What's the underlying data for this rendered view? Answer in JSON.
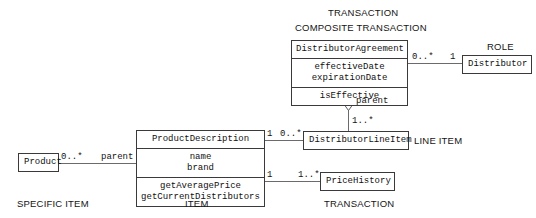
{
  "diagram": {
    "title_visible": false,
    "kind": "uml-class-diagram",
    "line_color": "#6b6b6b",
    "box_border_color": "#3a3a3a",
    "text_color": "#141414",
    "background": "#ffffff"
  },
  "classes": {
    "distributor_agreement": {
      "name": "DistributorAgreement",
      "attributes": [
        "effectiveDate",
        "expirationDate"
      ],
      "operations": [
        "isEffective"
      ]
    },
    "distributor": {
      "name": "Distributor"
    },
    "product_description": {
      "name": "ProductDescription",
      "attributes": [
        "name",
        "brand"
      ],
      "operations": [
        "getAveragePrice",
        "getCurrentDistributors"
      ]
    },
    "product": {
      "name": "Product"
    },
    "distributor_line_item": {
      "name": "DistributorLineItem"
    },
    "price_history": {
      "name": "PriceHistory"
    }
  },
  "annotations": {
    "transaction_top": "TRANSACTION",
    "composite_transaction": "COMPOSITE TRANSACTION",
    "role": "ROLE",
    "line_item": "LINE ITEM",
    "specific_item": "SPECIFIC ITEM",
    "item": "ITEM",
    "transaction_bottom": "TRANSACTION"
  },
  "associations": [
    {
      "id": "agreement-distributor",
      "from": "DistributorAgreement",
      "to": "Distributor",
      "from_multiplicity": "0..*",
      "to_multiplicity": "1"
    },
    {
      "id": "agreement-lineitem",
      "from": "DistributorAgreement",
      "to": "DistributorLineItem",
      "type": "aggregation",
      "role_name": "parent",
      "to_multiplicity": "1..*"
    },
    {
      "id": "productdescription-lineitem",
      "from": "ProductDescription",
      "to": "DistributorLineItem",
      "from_multiplicity": "1",
      "to_multiplicity": "0..*"
    },
    {
      "id": "productdescription-pricehistory",
      "from": "ProductDescription",
      "to": "PriceHistory",
      "from_multiplicity": "1",
      "to_multiplicity": "1..*"
    },
    {
      "id": "product-productdescription",
      "from": "Product",
      "to": "ProductDescription",
      "from_multiplicity": "0..*",
      "role_name": "parent"
    }
  ],
  "multiplicity_labels": {
    "agreement_to_distributor_left": "0..*",
    "agreement_to_distributor_right": "1",
    "lineitem_parent_mult": "1..*",
    "parent_role_top": "parent",
    "pd_lineitem_left": "1",
    "pd_lineitem_right": "0..*",
    "pd_pricehistory_left": "1",
    "pd_pricehistory_right": "1..*",
    "product_mult": "0..*",
    "parent_role_bottom": "parent"
  }
}
